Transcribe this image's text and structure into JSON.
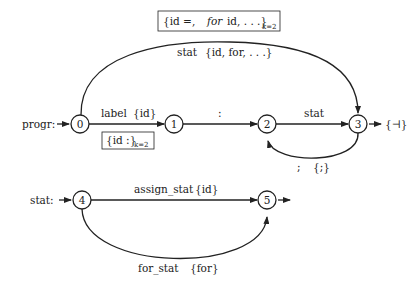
{
  "diagram": {
    "type": "automaton",
    "machines": [
      {
        "name": "progr",
        "label": "progr:",
        "entry_arrow": "→",
        "states": [
          {
            "id": "0",
            "label": "0"
          },
          {
            "id": "1",
            "label": "1"
          },
          {
            "id": "2",
            "label": "2"
          },
          {
            "id": "3",
            "label": "3",
            "final": true,
            "exit_label": "{⊣}"
          }
        ],
        "transitions": [
          {
            "from": "0",
            "to": "1",
            "symbol": "label",
            "lookahead": "{id}",
            "box": {
              "main": "{id :}",
              "sub": "k=2"
            }
          },
          {
            "from": "1",
            "to": "2",
            "symbol": ":",
            "lookahead": ""
          },
          {
            "from": "2",
            "to": "3",
            "symbol": "stat",
            "lookahead": ""
          },
          {
            "from": "3",
            "to": "2",
            "symbol": ";",
            "lookahead": "{;}"
          },
          {
            "from": "0",
            "to": "3",
            "symbol": "stat",
            "lookahead": "{id, for, . . .}",
            "box": {
              "main": "{id =,",
              "ital": "for",
              "rest": "id, . . .}",
              "sub": "k=2"
            }
          }
        ]
      },
      {
        "name": "stat",
        "label": "stat:",
        "entry_arrow": "→",
        "states": [
          {
            "id": "4",
            "label": "4"
          },
          {
            "id": "5",
            "label": "5",
            "final": true
          }
        ],
        "transitions": [
          {
            "from": "4",
            "to": "5",
            "symbol": "assign_stat",
            "lookahead": "{id}"
          },
          {
            "from": "4",
            "to": "5",
            "symbol": "for_stat",
            "lookahead": "{for}"
          }
        ]
      }
    ]
  },
  "labels": {
    "progr": "progr:",
    "stat_machine": "stat:",
    "arrow": "→",
    "n0": "0",
    "n1": "1",
    "n2": "2",
    "n3": "3",
    "n4": "4",
    "n5": "5",
    "e01_sym": "label",
    "e01_la": "{id}",
    "box01_main": "{id :}",
    "box01_sub": "k=2",
    "e12_sym": ":",
    "e23_sym": "stat",
    "e32_sym": ";",
    "e32_la": "{;}",
    "e03_sym": "stat",
    "e03_la": "{id, for, . . .}",
    "box03_a": "{id =,",
    "box03_ital": "for",
    "box03_b": "id, . . .}",
    "box03_sub": "k=2",
    "exit3": "{⊣}",
    "e45_sym": "assign_stat",
    "e45_la": "{id}",
    "e45b_sym": "for_stat",
    "e45b_la": "{for}"
  }
}
